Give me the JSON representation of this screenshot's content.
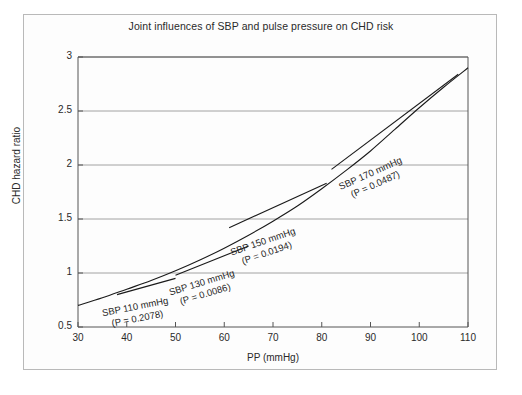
{
  "figure": {
    "title": "Joint influences of SBP and pulse pressure on CHD risk",
    "frame_color": "#b9b9b9",
    "line_color": "#1a1a1a",
    "grid_color": "#8c8c8c"
  },
  "chart_data": {
    "type": "line",
    "title": "Joint influences of SBP and pulse pressure on CHD risk",
    "xlabel": "PP (mmHg)",
    "ylabel": "CHD hazard ratio",
    "xlim": [
      30,
      110
    ],
    "ylim": [
      0.5,
      3
    ],
    "xticks": [
      30,
      40,
      50,
      60,
      70,
      80,
      90,
      100,
      110
    ],
    "yticks": [
      0.5,
      1,
      1.5,
      2,
      2.5,
      3
    ],
    "grid": "horizontal",
    "legend": "none",
    "series": [
      {
        "name": "Overall PP curve",
        "style": "solid",
        "x": [
          30,
          35,
          40,
          45,
          50,
          55,
          60,
          65,
          70,
          75,
          80,
          85,
          90,
          95,
          100,
          105,
          110
        ],
        "y": [
          0.7,
          0.77,
          0.85,
          0.93,
          1.02,
          1.12,
          1.23,
          1.35,
          1.48,
          1.62,
          1.78,
          1.95,
          2.13,
          2.33,
          2.53,
          2.72,
          2.9
        ]
      },
      {
        "name": "SBP 110 mmHg",
        "style": "solid",
        "x": [
          38,
          50
        ],
        "y": [
          0.8,
          0.95
        ]
      },
      {
        "name": "SBP 130 mmHg",
        "style": "solid",
        "x": [
          50,
          65
        ],
        "y": [
          0.98,
          1.25
        ]
      },
      {
        "name": "SBP 150 mmHg",
        "style": "solid",
        "x": [
          61,
          81
        ],
        "y": [
          1.42,
          1.83
        ]
      },
      {
        "name": "SBP 170 mmHg",
        "style": "solid",
        "x": [
          82,
          108
        ],
        "y": [
          1.96,
          2.84
        ]
      }
    ],
    "annotations": [
      {
        "id": "sbp-110",
        "sbp_label": "SBP 110 mmHg",
        "p_label": "(P = 0.2078)",
        "p_value": 0.2078,
        "sbp": 110
      },
      {
        "id": "sbp-130",
        "sbp_label": "SBP 130 mmHg",
        "p_label": "(P = 0.0086)",
        "p_value": 0.0086,
        "sbp": 130
      },
      {
        "id": "sbp-150",
        "sbp_label": "SBP 150 mmHg",
        "p_label": "(P = 0.0194)",
        "p_value": 0.0194,
        "sbp": 150
      },
      {
        "id": "sbp-170",
        "sbp_label": "SBP 170 mmHg",
        "p_label": "(P = 0.0487)",
        "p_value": 0.0487,
        "sbp": 170
      }
    ],
    "ytick_labels": [
      "0.5",
      "1",
      "1.5",
      "2",
      "2.5",
      "3"
    ],
    "xtick_labels": [
      "30",
      "40",
      "50",
      "60",
      "70",
      "80",
      "90",
      "100",
      "110"
    ]
  }
}
